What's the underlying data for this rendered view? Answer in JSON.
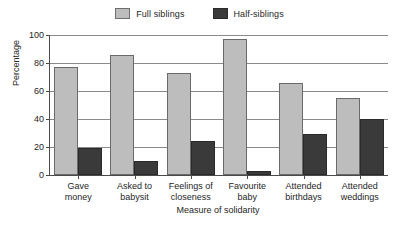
{
  "chart_data": {
    "type": "bar",
    "title": "",
    "xlabel": "Measure of solidarity",
    "ylabel": "Percentage",
    "ylim": [
      0,
      100
    ],
    "yticks": [
      0,
      20,
      40,
      60,
      80,
      100
    ],
    "grid": true,
    "legend_position": "top-center",
    "categories": [
      "Gave money",
      "Asked to babysit",
      "Feelings of closeness",
      "Favourite baby",
      "Attended birthdays",
      "Attended weddings"
    ],
    "category_lines": [
      [
        "Gave",
        "money"
      ],
      [
        "Asked to",
        "babysit"
      ],
      [
        "Feelings of",
        "closeness"
      ],
      [
        "Favourite",
        "baby"
      ],
      [
        "Attended",
        "birthdays"
      ],
      [
        "Attended",
        "weddings"
      ]
    ],
    "series": [
      {
        "name": "Full siblings",
        "color": "#bdbdbd",
        "values": [
          77,
          86,
          73,
          97,
          66,
          55
        ]
      },
      {
        "name": "Half-siblings",
        "color": "#3a3a3a",
        "values": [
          19,
          10,
          24,
          3,
          29,
          40
        ]
      }
    ]
  },
  "legend": {
    "items": [
      {
        "label": "Full siblings",
        "color": "#bdbdbd"
      },
      {
        "label": "Half-siblings",
        "color": "#3a3a3a"
      }
    ]
  },
  "axes": {
    "y_title": "Percentage",
    "x_title": "Measure of solidarity",
    "y_tick_labels": [
      "0",
      "20",
      "40",
      "60",
      "80",
      "100"
    ]
  }
}
